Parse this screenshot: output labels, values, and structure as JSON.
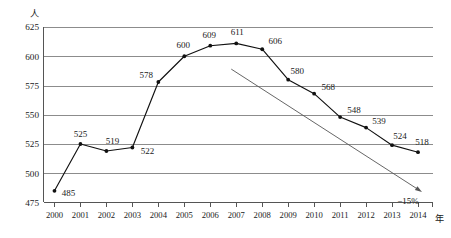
{
  "chart_data": {
    "type": "line",
    "title": "",
    "xlabel": "年",
    "ylabel": "人",
    "x": [
      "2000",
      "2001",
      "2002",
      "2003",
      "2004",
      "2005",
      "2006",
      "2007",
      "2008",
      "2009",
      "2010",
      "2011",
      "2012",
      "2013",
      "2014"
    ],
    "categories": [
      "2000",
      "2001",
      "2002",
      "2003",
      "2004",
      "2005",
      "2006",
      "2007",
      "2008",
      "2009",
      "2010",
      "2011",
      "2012",
      "2013",
      "2014"
    ],
    "values": [
      485,
      525,
      519,
      522,
      578,
      600,
      609,
      611,
      606,
      580,
      568,
      548,
      539,
      524,
      518
    ],
    "series": [
      {
        "name": "人数",
        "values": [
          485,
          525,
          519,
          522,
          578,
          600,
          609,
          611,
          606,
          580,
          568,
          548,
          539,
          524,
          518
        ]
      }
    ],
    "point_labels": [
      "485",
      "525",
      "519",
      "522",
      "578",
      "600",
      "609",
      "611",
      "606",
      "580",
      "568",
      "548",
      "539",
      "524",
      "518"
    ],
    "ylim": [
      475,
      625
    ],
    "yticks": [
      475,
      500,
      525,
      550,
      575,
      600,
      625
    ],
    "ytick_labels": [
      "475",
      "500",
      "525",
      "550",
      "575",
      "600",
      "625"
    ],
    "grid": true,
    "legend": false,
    "legend_position": "none",
    "annotations": [
      {
        "name": "trend-arrow",
        "label": "−15%",
        "from_year": "2007",
        "from_value": 589,
        "to_year": "2014",
        "to_value": 484
      }
    ],
    "axis_unit_y": "人",
    "axis_unit_x": "年",
    "colors": {
      "line": "#111111",
      "marker": "#111111",
      "grid": "#808080",
      "axis": "#555555",
      "trend": "#555555",
      "background": "#ffffff"
    }
  }
}
